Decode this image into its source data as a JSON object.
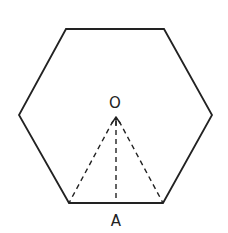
{
  "diagram": {
    "type": "regular-hexagon",
    "stroke_color": "#222222",
    "hexagon": {
      "vertices": [
        [
          66,
          29
        ],
        [
          164,
          29
        ],
        [
          212,
          115
        ],
        [
          163,
          203
        ],
        [
          69,
          203
        ],
        [
          19,
          115
        ]
      ]
    },
    "center": {
      "label": "O",
      "point": [
        116,
        117
      ],
      "label_pos": [
        115,
        103
      ]
    },
    "midpoint": {
      "label": "A",
      "point": [
        116,
        203
      ],
      "label_pos": [
        116,
        221
      ]
    },
    "dashed_segments": [
      {
        "name": "O-to-left-bottom-vertex",
        "from": [
          113,
          121
        ],
        "to": [
          69,
          203
        ]
      },
      {
        "name": "O-to-A",
        "from": [
          116,
          121
        ],
        "to": [
          116,
          203
        ]
      },
      {
        "name": "O-to-right-bottom-vertex",
        "from": [
          119,
          121
        ],
        "to": [
          163,
          203
        ]
      }
    ],
    "arrowhead": {
      "tip": [
        116,
        117
      ],
      "direction": "up"
    }
  }
}
